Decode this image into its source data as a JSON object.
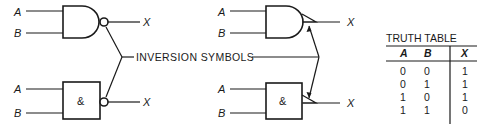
{
  "diagram": {
    "callout_label": "INVERSION SYMBOLS",
    "gates": [
      {
        "id": "nand-distinctive-bubble",
        "shape": "distinctive",
        "inversion": "bubble",
        "inputs": [
          "A",
          "B"
        ],
        "output": "X"
      },
      {
        "id": "nand-rectangular-bubble",
        "shape": "rectangular",
        "symbol": "&",
        "inversion": "bubble",
        "inputs": [
          "A",
          "B"
        ],
        "output": "X"
      },
      {
        "id": "nand-distinctive-triangle",
        "shape": "distinctive",
        "inversion": "triangle",
        "inputs": [
          "A",
          "B"
        ],
        "output": "X"
      },
      {
        "id": "nand-rectangular-triangle",
        "shape": "rectangular",
        "symbol": "&",
        "inversion": "triangle",
        "inputs": [
          "A",
          "B"
        ],
        "output": "X"
      }
    ]
  },
  "labels": {
    "input_a": "A",
    "input_b": "B",
    "output_x": "X",
    "and_symbol": "&"
  },
  "truth_table": {
    "title": "TRUTH TABLE",
    "headers": [
      "A",
      "B",
      "X"
    ],
    "rows": [
      [
        "0",
        "0",
        "1"
      ],
      [
        "0",
        "1",
        "1"
      ],
      [
        "1",
        "0",
        "1"
      ],
      [
        "1",
        "1",
        "0"
      ]
    ]
  },
  "colors": {
    "ink": "#1a1a1a",
    "background": "#ffffff"
  }
}
